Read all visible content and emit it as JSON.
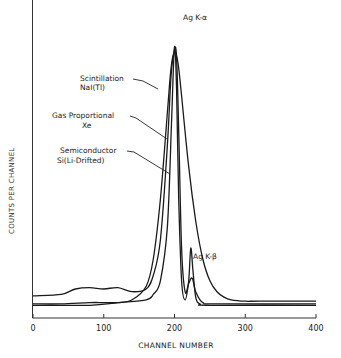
{
  "chart_data": {
    "type": "line",
    "title": "",
    "xlabel": "CHANNEL NUMBER",
    "ylabel": "COUNTS PER CHANNEL",
    "xlim": [
      0,
      400
    ],
    "ylim": [
      0,
      100
    ],
    "x_ticks": [
      0,
      100,
      200,
      300,
      400
    ],
    "x_tick_labels": [
      "0",
      "100",
      "200",
      "300",
      "400"
    ],
    "y_ticks": [],
    "grid": false,
    "legend": "inline annotations with leader lines",
    "annotations": [
      {
        "text": "Ag K-α",
        "x": 210,
        "y": 100
      },
      {
        "text": "Ag K-β",
        "x": 226,
        "y": 10
      }
    ],
    "series": [
      {
        "name": "Scintillation NaI(Tl)",
        "x": [
          0,
          40,
          80,
          100,
          120,
          140,
          160,
          170,
          180,
          190,
          195,
          200,
          205,
          210,
          220,
          230,
          240,
          250,
          260,
          270,
          280,
          300,
          320,
          400
        ],
        "y": [
          1.5,
          1.5,
          2,
          2,
          2,
          3,
          8,
          18,
          40,
          72,
          88,
          94,
          90,
          78,
          52,
          32,
          18,
          10,
          6,
          4,
          3,
          2.5,
          2.5,
          2.5
        ]
      },
      {
        "name": "Gas Proportional Xe",
        "x": [
          0,
          40,
          60,
          80,
          100,
          120,
          140,
          160,
          170,
          180,
          190,
          195,
          200,
          203,
          206,
          210,
          215,
          220,
          225,
          230,
          240,
          260,
          400
        ],
        "y": [
          4.5,
          5,
          7,
          7.5,
          7,
          7.5,
          6,
          7,
          12,
          25,
          60,
          85,
          95,
          92,
          65,
          22,
          6,
          9,
          11,
          6,
          2,
          1.5,
          1.5
        ]
      },
      {
        "name": "Semiconductor Si(Li-Drifted)",
        "x": [
          0,
          80,
          120,
          160,
          170,
          180,
          190,
          196,
          200,
          203,
          206,
          210,
          215,
          220,
          223,
          226,
          230,
          236,
          250,
          400
        ],
        "y": [
          1,
          1,
          2,
          3,
          5,
          10,
          30,
          70,
          96,
          80,
          40,
          10,
          3,
          10,
          22,
          14,
          4,
          1.5,
          1,
          1
        ]
      }
    ]
  },
  "labels": {
    "ka": "Ag K-α",
    "kb": "Ag K-β",
    "scint_1": "Scintillation",
    "scint_2": "NaI(Tl)",
    "gas_1": "Gas Proportional",
    "gas_2": "Xe",
    "semi_1": "Semiconductor",
    "semi_2": "Si(Li-Drifted)"
  }
}
